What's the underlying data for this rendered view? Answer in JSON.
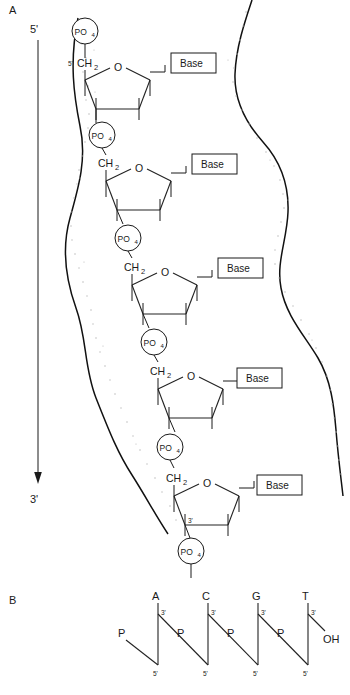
{
  "figure": {
    "panels": [
      {
        "id": "A",
        "label": "A"
      },
      {
        "id": "B",
        "label": "B"
      }
    ]
  },
  "panel_a": {
    "label": "A",
    "direction_arrow": {
      "start_label": "5'",
      "end_label": "3'",
      "description": "vertical downward arrow indicating 5-prime to 3-prime polarity"
    },
    "envelope": {
      "description": "wavy stippled band representing the sugar-phosphate backbone region"
    },
    "nucleotides": [
      {
        "index": 1,
        "phosphate_top": "PO4",
        "carbon_label": "CH2",
        "carbon_prime": "5'",
        "ring_oxygen": "O",
        "base_label": "Base",
        "phosphate_bottom": "PO4",
        "sugar_prime": ""
      },
      {
        "index": 2,
        "phosphate_top": "PO4",
        "carbon_label": "CH2",
        "carbon_prime": "",
        "ring_oxygen": "O",
        "base_label": "Base",
        "phosphate_bottom": "PO4",
        "sugar_prime": ""
      },
      {
        "index": 3,
        "phosphate_top": "PO4",
        "carbon_label": "CH2",
        "carbon_prime": "",
        "ring_oxygen": "O",
        "base_label": "Base",
        "phosphate_bottom": "PO4",
        "sugar_prime": ""
      },
      {
        "index": 4,
        "phosphate_top": "PO4",
        "carbon_label": "CH2",
        "carbon_prime": "",
        "ring_oxygen": "O",
        "base_label": "Base",
        "phosphate_bottom": "PO4",
        "sugar_prime": ""
      },
      {
        "index": 5,
        "phosphate_top": "PO4",
        "carbon_label": "CH2",
        "carbon_prime": "",
        "ring_oxygen": "O",
        "base_label": "Base",
        "phosphate_bottom": "PO4",
        "sugar_prime": "3'"
      }
    ],
    "phosphate_text": {
      "main": "PO",
      "subscript": "4"
    },
    "carbon_text": {
      "main": "CH",
      "subscript": "2"
    },
    "oxygen_text": "O",
    "base_text": "Base"
  },
  "panel_b": {
    "label": "B",
    "phosphate_label": "P",
    "terminal_hydroxyl": "OH",
    "prime_three": "3'",
    "prime_five": "5'",
    "residues": [
      {
        "base": "A",
        "three_prime": "3'",
        "five_prime": "5'",
        "left_phosphate": "P"
      },
      {
        "base": "C",
        "three_prime": "3'",
        "five_prime": "5'",
        "left_phosphate": "P"
      },
      {
        "base": "G",
        "three_prime": "3'",
        "five_prime": "5'",
        "left_phosphate": "P"
      },
      {
        "base": "T",
        "three_prime": "3'",
        "five_prime": "5'",
        "left_phosphate": "P"
      }
    ],
    "sequence": "A C G T"
  },
  "colors": {
    "ink": "#1a1a1a",
    "stipple": "#b9b9b9",
    "background": "#ffffff"
  }
}
